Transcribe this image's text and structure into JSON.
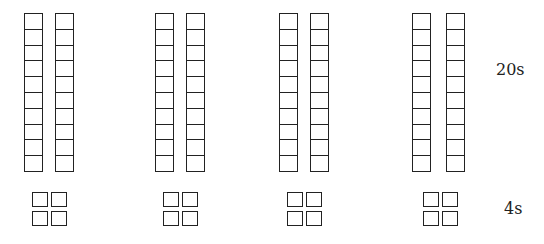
{
  "diagram": {
    "cells_per_rod": 10,
    "groups": [
      {
        "rods": 2,
        "units": 4,
        "rod_x": [
          24,
          55
        ],
        "unit_x": [
          32,
          51
        ]
      },
      {
        "rods": 2,
        "units": 4,
        "rod_x": [
          155,
          186
        ],
        "unit_x": [
          163,
          182
        ]
      },
      {
        "rods": 2,
        "units": 4,
        "rod_x": [
          279,
          310
        ],
        "unit_x": [
          287,
          306
        ]
      },
      {
        "rods": 2,
        "units": 4,
        "rod_x": [
          412,
          446
        ],
        "unit_x": [
          423,
          442
        ]
      }
    ],
    "labels": {
      "rods_row": "20s",
      "units_row": "4s"
    },
    "colors": {
      "stroke": "#222222",
      "background": "#ffffff"
    }
  }
}
